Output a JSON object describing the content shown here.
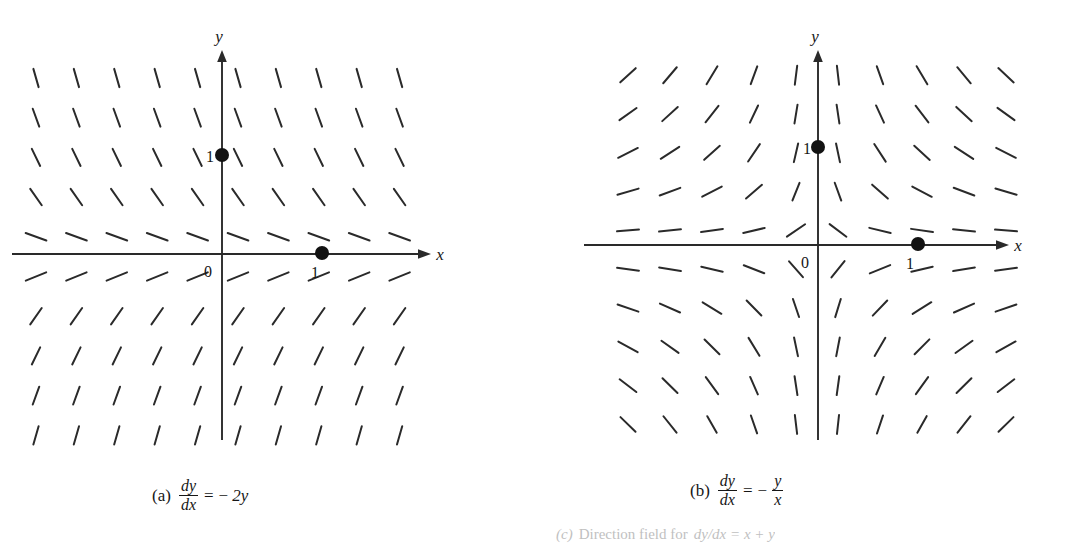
{
  "figure": {
    "kind": "direction-field-figure",
    "background_color": "#ffffff",
    "stroke_color": "#2a2a2a",
    "axis_color": "#2a2a2a",
    "footnote": {
      "prefix": "(c)",
      "text": "Direction field for",
      "equation": "dy/dx = x + y"
    }
  },
  "panels": [
    {
      "id": "a",
      "tag": "(a)",
      "equation": {
        "numerator": "dy",
        "denominator": "dx",
        "equals": "=",
        "minus": "−",
        "rhs": "2y",
        "rhs_kind": "plain"
      },
      "axes": {
        "x_label": "x",
        "y_label": "y",
        "origin_label": "0",
        "x_tick_label": "1",
        "y_tick_label": "1"
      },
      "marked_points": [
        {
          "label": "1",
          "x": 1,
          "y": 0
        },
        {
          "label": "1",
          "x": 0,
          "y": 1
        }
      ]
    },
    {
      "id": "b",
      "tag": "(b)",
      "equation": {
        "numerator": "dy",
        "denominator": "dx",
        "equals": "=",
        "minus": "−",
        "rhs_numerator": "y",
        "rhs_denominator": "x",
        "rhs_kind": "fraction"
      },
      "axes": {
        "x_label": "x",
        "y_label": "y",
        "origin_label": "0",
        "x_tick_label": "1",
        "y_tick_label": "1"
      },
      "marked_points": [
        {
          "label": "1",
          "x": 1,
          "y": 0
        },
        {
          "label": "1",
          "x": 0,
          "y": 1
        }
      ]
    }
  ],
  "chart_data": [
    {
      "type": "scatter",
      "subtype": "direction-field",
      "panel": "a",
      "title": "(a) dy/dx = -2y",
      "equation": "dy/dx = -2y",
      "slope_formula": "-2*y",
      "xlabel": "x",
      "ylabel": "y",
      "xlim": [
        -2.35,
        2.15
      ],
      "ylim": [
        -2.1,
        2.1
      ],
      "grid": false,
      "legend": null,
      "x_ticks": [
        1
      ],
      "y_ticks": [
        1
      ],
      "origin_label": "0",
      "nx": 10,
      "ny": 10,
      "x_grid_values": [
        -1.85,
        -1.45,
        -1.05,
        -0.65,
        -0.25,
        0.15,
        0.55,
        0.95,
        1.35,
        1.75
      ],
      "y_grid_values": [
        1.78,
        1.38,
        0.98,
        0.58,
        0.18,
        -0.22,
        -0.62,
        -1.02,
        -1.42,
        -1.82
      ],
      "row_slope_angles_deg": [
        -74,
        -70,
        -64,
        -55,
        -20,
        22,
        55,
        64,
        70,
        74
      ],
      "annotations": [
        {
          "text": "1",
          "x": 1,
          "y": 0,
          "kind": "point-label"
        },
        {
          "text": "1",
          "x": 0,
          "y": 1,
          "kind": "point-label"
        },
        {
          "text": "0",
          "x": 0,
          "y": 0,
          "kind": "origin-label"
        }
      ]
    },
    {
      "type": "scatter",
      "subtype": "direction-field",
      "panel": "b",
      "title": "(b) dy/dx = -y/x",
      "equation": "dy/dx = -y/x",
      "slope_formula": "-y/x",
      "xlabel": "x",
      "ylabel": "y",
      "xlim": [
        -2.0,
        2.0
      ],
      "ylim": [
        -2.0,
        2.3
      ],
      "grid": false,
      "legend": null,
      "x_ticks": [
        1
      ],
      "y_ticks": [
        1
      ],
      "origin_label": "0",
      "nx": 10,
      "ny": 10,
      "x_grid_values": [
        -1.9,
        -1.48,
        -1.06,
        -0.64,
        -0.22,
        0.2,
        0.62,
        1.04,
        1.46,
        1.88
      ],
      "y_grid_values": [
        1.75,
        1.35,
        0.95,
        0.55,
        0.15,
        -0.25,
        -0.65,
        -1.05,
        -1.45,
        -1.85
      ],
      "annotations": [
        {
          "text": "1",
          "x": 1,
          "y": 0,
          "kind": "point-label"
        },
        {
          "text": "1",
          "x": 0,
          "y": 1,
          "kind": "point-label"
        },
        {
          "text": "0",
          "x": 0,
          "y": 0,
          "kind": "origin-label"
        }
      ]
    }
  ]
}
